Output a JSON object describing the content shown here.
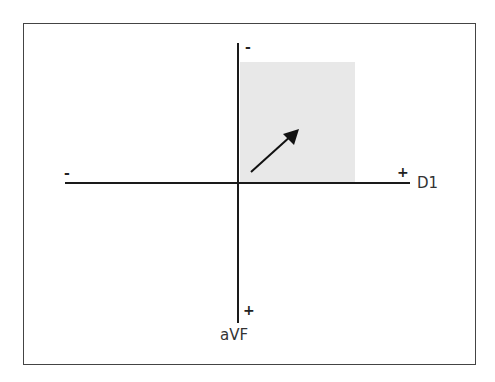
{
  "diagram": {
    "type": "axis-quadrant",
    "horizontal_axis": {
      "label": "D1",
      "neg_sign": "-",
      "pos_sign": "+"
    },
    "vertical_axis": {
      "label": "aVF",
      "neg_sign": "-",
      "pos_sign": "+"
    },
    "shaded_quadrant": {
      "description": "D1 positive, aVF negative",
      "color": "#e8e8e8"
    },
    "vector": {
      "direction": "up-right",
      "color": "#111111"
    },
    "colors": {
      "axis": "#1a1a1a",
      "frame": "#444444",
      "shade": "#e8e8e8",
      "background": "#ffffff"
    }
  }
}
